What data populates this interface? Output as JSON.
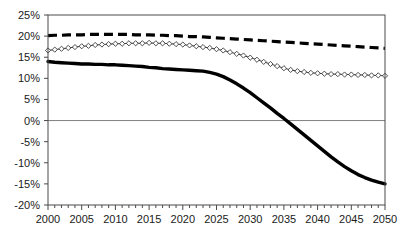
{
  "chart_data": {
    "type": "line",
    "title": "",
    "subtitle": "",
    "xlabel": "",
    "ylabel": "",
    "xlim": [
      2000,
      2050
    ],
    "ylim": [
      -20,
      25
    ],
    "y_tick_step": 5,
    "x_tick_step": 5,
    "x_minor_tick_step": 1,
    "grid": false,
    "zero_line": true,
    "legend_position": "none",
    "y_tick_labels": [
      "25%",
      "20%",
      "15%",
      "10%",
      "5%",
      "0%",
      "-5%",
      "-10%",
      "-15%",
      "-20%"
    ],
    "y_tick_values": [
      25,
      20,
      15,
      10,
      5,
      0,
      -5,
      -10,
      -15,
      -20
    ],
    "x_tick_labels": [
      "2000",
      "2005",
      "2010",
      "2015",
      "2020",
      "2025",
      "2030",
      "2035",
      "2040",
      "2045",
      "2050"
    ],
    "x_tick_values": [
      2000,
      2005,
      2010,
      2015,
      2020,
      2025,
      2030,
      2035,
      2040,
      2045,
      2050
    ],
    "x": [
      2000,
      2001,
      2002,
      2003,
      2004,
      2005,
      2006,
      2007,
      2008,
      2009,
      2010,
      2011,
      2012,
      2013,
      2014,
      2015,
      2016,
      2017,
      2018,
      2019,
      2020,
      2021,
      2022,
      2023,
      2024,
      2025,
      2026,
      2027,
      2028,
      2029,
      2030,
      2031,
      2032,
      2033,
      2034,
      2035,
      2036,
      2037,
      2038,
      2039,
      2040,
      2041,
      2042,
      2043,
      2044,
      2045,
      2046,
      2047,
      2048,
      2049,
      2050
    ],
    "series": [
      {
        "name": "dashed-upper",
        "style": "dashed",
        "marker": "none",
        "color": "#000000",
        "width": 3.2,
        "values": [
          20.1,
          20.2,
          20.2,
          20.3,
          20.3,
          20.3,
          20.4,
          20.4,
          20.4,
          20.4,
          20.4,
          20.4,
          20.4,
          20.3,
          20.3,
          20.3,
          20.2,
          20.2,
          20.1,
          20.1,
          20.0,
          19.9,
          19.9,
          19.8,
          19.7,
          19.6,
          19.5,
          19.4,
          19.3,
          19.2,
          19.1,
          19.0,
          18.9,
          18.8,
          18.7,
          18.6,
          18.5,
          18.4,
          18.3,
          18.2,
          18.1,
          18.0,
          17.9,
          17.8,
          17.7,
          17.6,
          17.5,
          17.4,
          17.3,
          17.2,
          17.1
        ]
      },
      {
        "name": "diamond-middle",
        "style": "solid",
        "marker": "diamond",
        "color": "#3a3a3a",
        "width": 1,
        "values": [
          16.6,
          16.8,
          17.0,
          17.2,
          17.4,
          17.6,
          17.7,
          17.9,
          18.0,
          18.1,
          18.2,
          18.2,
          18.3,
          18.3,
          18.3,
          18.4,
          18.3,
          18.3,
          18.2,
          18.1,
          18.0,
          17.8,
          17.6,
          17.4,
          17.2,
          16.9,
          16.6,
          16.2,
          15.8,
          15.4,
          14.9,
          14.4,
          13.9,
          13.4,
          12.9,
          12.4,
          12.0,
          11.7,
          11.5,
          11.3,
          11.2,
          11.1,
          11.0,
          11.0,
          10.9,
          10.9,
          10.8,
          10.8,
          10.7,
          10.7,
          10.6
        ]
      },
      {
        "name": "solid-lower",
        "style": "solid",
        "marker": "none",
        "color": "#000000",
        "width": 3.4,
        "values": [
          14.0,
          13.8,
          13.7,
          13.6,
          13.5,
          13.4,
          13.4,
          13.3,
          13.3,
          13.2,
          13.2,
          13.1,
          13.0,
          12.9,
          12.8,
          12.6,
          12.5,
          12.3,
          12.2,
          12.1,
          12.0,
          11.9,
          11.8,
          11.7,
          11.4,
          11.0,
          10.4,
          9.6,
          8.7,
          7.7,
          6.6,
          5.4,
          4.2,
          3.0,
          1.7,
          0.5,
          -0.8,
          -2.1,
          -3.4,
          -4.7,
          -6.0,
          -7.3,
          -8.6,
          -9.8,
          -10.9,
          -11.9,
          -12.8,
          -13.5,
          -14.1,
          -14.6,
          -15.0
        ]
      }
    ]
  },
  "plot_frame": {
    "left_px": 48,
    "top_px": 15,
    "right_px": 385,
    "bottom_px": 205
  }
}
